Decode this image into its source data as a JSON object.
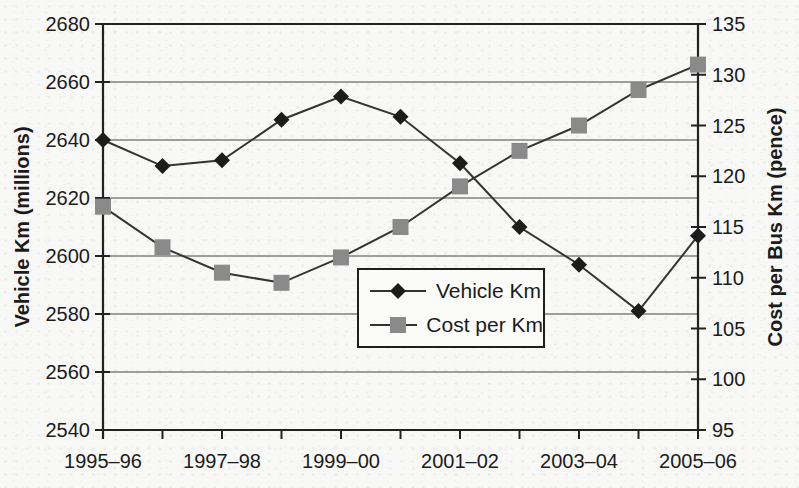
{
  "chart_data": {
    "type": "line",
    "title": "",
    "n_points": 11,
    "x_tick_labels": [
      "1995–96",
      "1997–98",
      "1999–00",
      "2001–02",
      "2003–04",
      "2005–06"
    ],
    "x_label_indices": [
      0,
      2,
      4,
      6,
      8,
      10
    ],
    "left_axis": {
      "label": "Vehicle Km (millions)",
      "min": 2540,
      "max": 2680,
      "step": 20,
      "ticks": [
        "2680",
        "2660",
        "2640",
        "2620",
        "2600",
        "2580",
        "2560",
        "2540"
      ]
    },
    "right_axis": {
      "label": "Cost per Bus Km (pence)",
      "min": 95,
      "max": 135,
      "step": 5,
      "ticks": [
        "135",
        "130",
        "125",
        "120",
        "115",
        "110",
        "105",
        "100",
        "95"
      ]
    },
    "series": [
      {
        "name": "Vehicle Km",
        "axis": "left",
        "marker": "diamond",
        "values": [
          2640,
          2631,
          2633,
          2647,
          2655,
          2648,
          2632,
          2610,
          2597,
          2581,
          2607
        ]
      },
      {
        "name": "Cost per Km",
        "axis": "right",
        "marker": "square",
        "values": [
          117,
          113,
          110.5,
          109.5,
          112,
          115,
          119,
          122.5,
          125,
          128.5,
          131
        ]
      }
    ],
    "legend": {
      "position": "inside-lower-center",
      "entries": [
        "Vehicle Km",
        "Cost per Km"
      ]
    },
    "grid": "horizontal-only",
    "colors": {
      "diamond_marker": "#1c1c1c",
      "square_marker": "#8a8a8a",
      "series_line": "#333333",
      "gridline": "#454545",
      "axis_line": "#222222",
      "text": "#1b1b1b",
      "background_paper": "#f8f8f6"
    }
  }
}
